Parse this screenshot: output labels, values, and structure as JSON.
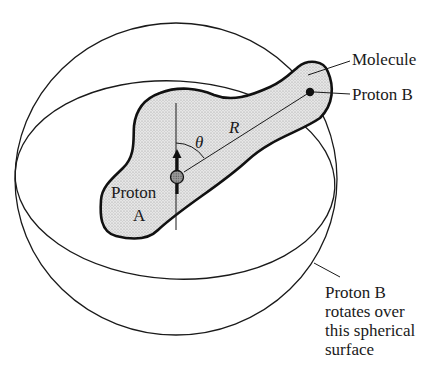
{
  "figure": {
    "type": "schematic-diagram",
    "labels": {
      "molecule": "Molecule",
      "proton_b": "Proton B",
      "proton_a_line1": "Proton",
      "proton_a_line2": "A",
      "theta": "θ",
      "distance": "R",
      "sphere_caption": [
        "Proton B",
        "rotates over",
        "this spherical",
        "surface"
      ]
    },
    "colors": {
      "stroke": "#1a1a1a",
      "molecule_fill": "#d9d9d9",
      "proton_a_fill": "#8c8c8c",
      "proton_b_fill": "#111111",
      "background": "#ffffff"
    },
    "elements": {
      "sphere": "spherical surface (circle outline)",
      "equator": "equatorial ellipse of sphere",
      "molecule_blob": "stippled molecule outline",
      "proton_a": "gray sphere with upward spin arrow",
      "proton_b": "black dot at end of molecule",
      "axis": "vertical field axis through proton A",
      "vector_r": "line R from proton A to proton B",
      "angle_theta": "angle arc between axis and R"
    }
  }
}
